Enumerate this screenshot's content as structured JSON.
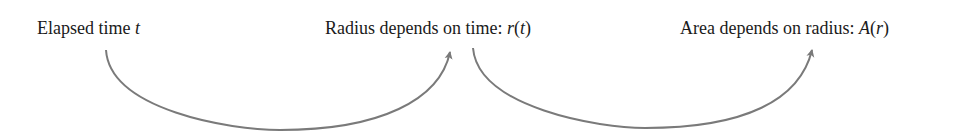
{
  "diagram": {
    "nodes": [
      {
        "id": "time",
        "text": "Elapsed time ",
        "var": "t"
      },
      {
        "id": "radius",
        "text": "Radius depends on time: ",
        "func": "r",
        "arg": "t"
      },
      {
        "id": "area",
        "text": "Area depends on radius: ",
        "func": "A",
        "arg": "r"
      }
    ],
    "edges": [
      {
        "from": "time",
        "to": "radius"
      },
      {
        "from": "radius",
        "to": "area"
      }
    ],
    "colors": {
      "text": "#1a1a1a",
      "arrow": "#7a7a7a"
    }
  }
}
